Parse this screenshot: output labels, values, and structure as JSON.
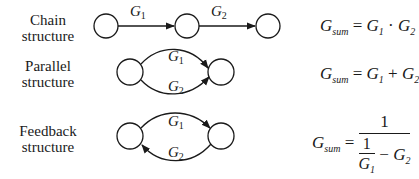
{
  "rows": [
    {
      "label_line1": "Chain",
      "label_line2": "structure",
      "edge_labels": [
        "G",
        "1",
        "G",
        "2"
      ],
      "formula": {
        "lhs": "G",
        "lhs_sub": "sum",
        "eq": "=",
        "a": "G",
        "a_sub": "1",
        "op": "·",
        "b": "G",
        "b_sub": "2"
      }
    },
    {
      "label_line1": "Parallel",
      "label_line2": "structure",
      "edge_labels": [
        "G",
        "1",
        "G",
        "2"
      ],
      "formula": {
        "lhs": "G",
        "lhs_sub": "sum",
        "eq": "=",
        "a": "G",
        "a_sub": "1",
        "op": "+",
        "b": "G",
        "b_sub": "2"
      }
    },
    {
      "label_line1": "Feedback",
      "label_line2": "structure",
      "edge_labels": [
        "G",
        "1",
        "G",
        "2"
      ],
      "formula": {
        "lhs": "G",
        "lhs_sub": "sum",
        "eq": "=",
        "numerator": "1",
        "inner_num": "1",
        "inner_den": "G",
        "inner_den_sub": "1",
        "minus": "−",
        "b": "G",
        "b_sub": "2"
      }
    }
  ],
  "colors": {
    "stroke": "#1a1a1a",
    "background": "#ffffff"
  }
}
